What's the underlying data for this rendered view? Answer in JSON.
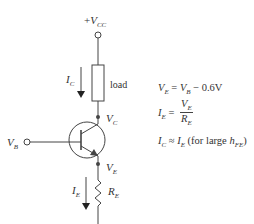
{
  "diagram": {
    "colors": {
      "line": "#444444",
      "text": "#333333",
      "background": "#ffffff"
    },
    "supply": {
      "prefix": "+",
      "symbol": "V",
      "subscript": "CC"
    },
    "load_label": "load",
    "collector_current": {
      "symbol": "I",
      "subscript": "C"
    },
    "collector_node": {
      "symbol": "V",
      "subscript": "C"
    },
    "base_input": {
      "symbol": "V",
      "subscript": "B"
    },
    "emitter_node": {
      "symbol": "V",
      "subscript": "E"
    },
    "emitter_current": {
      "symbol": "I",
      "subscript": "E"
    },
    "emitter_resistor": {
      "symbol": "R",
      "subscript": "E"
    },
    "transistor": {
      "type": "NPN"
    }
  },
  "equations": [
    {
      "lhs": {
        "symbol": "V",
        "subscript": "E"
      },
      "op": "=",
      "rhs_symbol": "V",
      "rhs_subscript": "B",
      "rhs_rest": " − 0.6V"
    },
    {
      "lhs": {
        "symbol": "I",
        "subscript": "E"
      },
      "op": "=",
      "numerator": {
        "symbol": "V",
        "subscript": "E"
      },
      "denominator": {
        "symbol": "R",
        "subscript": "E"
      }
    },
    {
      "lhs": {
        "symbol": "I",
        "subscript": "C"
      },
      "op": "≈",
      "rhs_symbol": "I",
      "rhs_subscript": "E",
      "rhs_rest": " (for large ",
      "tail_symbol": "h",
      "tail_subscript": "FE",
      "tail_close": ")"
    }
  ]
}
